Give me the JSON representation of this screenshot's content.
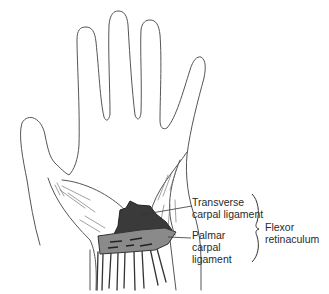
{
  "figure": {
    "labels": {
      "transverse": [
        "Transverse",
        "carpal ligament"
      ],
      "palmar": [
        "Palmar",
        "carpal",
        "ligament"
      ],
      "group": [
        "Flexor",
        "retinaculum"
      ]
    },
    "colors": {
      "outline": "#555555",
      "transverse_fill": "#3a3a3a",
      "palmar_fill": "#8a8a8a",
      "text": "#2a2a2a"
    }
  }
}
